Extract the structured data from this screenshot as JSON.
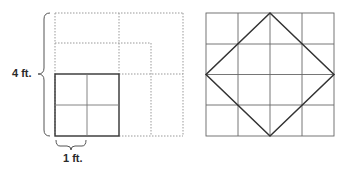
{
  "left_figure": {
    "height_label": "4 ft.",
    "width_label": "1 ft.",
    "description": "A 2x2 grid of 1 ft squares (solid) inside a 4x4 dotted outline, with nested dotted squares"
  },
  "right_figure": {
    "description": "4x4 grid with a diamond inscribed connecting edge midpoints"
  },
  "colors": {
    "solid_line": "#333333",
    "grid_line": "#666666",
    "dotted_line": "#999999",
    "label": "#2a2a2a"
  }
}
